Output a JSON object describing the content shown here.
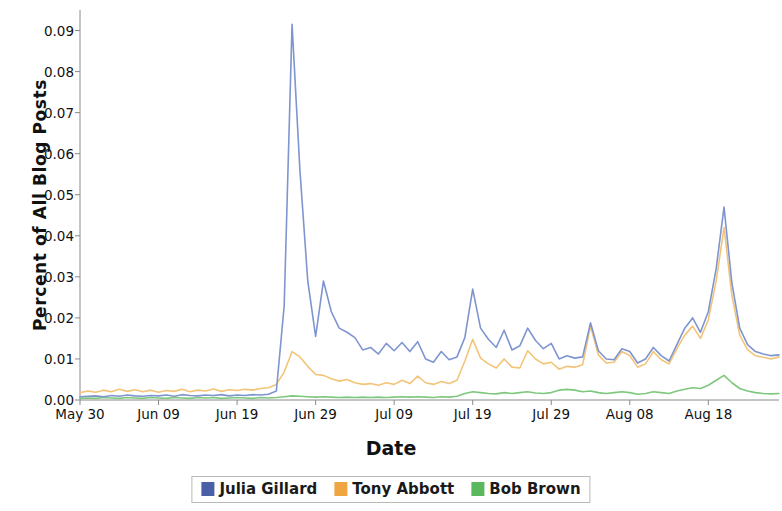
{
  "chart_data": {
    "type": "line",
    "title": "",
    "xlabel": "Date",
    "ylabel": "Percent of All Blog Posts",
    "grid": false,
    "legend_position": "bottom",
    "ylim": [
      0.0,
      0.095
    ],
    "ytick_labels": [
      "0.00",
      "0.01",
      "0.02",
      "0.03",
      "0.04",
      "0.05",
      "0.06",
      "0.07",
      "0.08",
      "0.09"
    ],
    "ytick_values": [
      0.0,
      0.01,
      0.02,
      0.03,
      0.04,
      0.05,
      0.06,
      0.07,
      0.08,
      0.09
    ],
    "xtick_labels": [
      "May 30",
      "Jun 09",
      "Jun 19",
      "Jun 29",
      "Jul 09",
      "Jul 19",
      "Jul 29",
      "Aug 08",
      "Aug 18"
    ],
    "xtick_indices": [
      0,
      10,
      20,
      30,
      40,
      50,
      60,
      70,
      80
    ],
    "x_index_count": 90,
    "series": [
      {
        "name": "Julia Gillard",
        "color": "#4a5fa5",
        "line_color": "#7f95d0",
        "values": [
          0.0008,
          0.0009,
          0.001,
          0.0008,
          0.0011,
          0.0009,
          0.0012,
          0.001,
          0.0009,
          0.0011,
          0.001,
          0.0012,
          0.0009,
          0.0013,
          0.0011,
          0.001,
          0.0012,
          0.0011,
          0.0013,
          0.001,
          0.0012,
          0.0011,
          0.0013,
          0.0012,
          0.0014,
          0.0022,
          0.023,
          0.0915,
          0.056,
          0.029,
          0.0155,
          0.029,
          0.0215,
          0.0175,
          0.0165,
          0.0152,
          0.0122,
          0.0128,
          0.0112,
          0.0138,
          0.012,
          0.014,
          0.0118,
          0.0142,
          0.01,
          0.0092,
          0.0118,
          0.0098,
          0.0105,
          0.0152,
          0.027,
          0.0175,
          0.0148,
          0.0128,
          0.017,
          0.0122,
          0.0132,
          0.0175,
          0.0145,
          0.0125,
          0.0138,
          0.01,
          0.0108,
          0.0102,
          0.0105,
          0.0188,
          0.012,
          0.01,
          0.0098,
          0.0125,
          0.0118,
          0.009,
          0.01,
          0.0128,
          0.0108,
          0.0095,
          0.0135,
          0.0175,
          0.02,
          0.0165,
          0.0215,
          0.032,
          0.047,
          0.0285,
          0.0175,
          0.0135,
          0.0118,
          0.0112,
          0.0108,
          0.011
        ]
      },
      {
        "name": "Tony Abbott",
        "color": "#f0a640",
        "line_color": "#f3c477",
        "values": [
          0.0018,
          0.0022,
          0.0019,
          0.0024,
          0.002,
          0.0026,
          0.0021,
          0.0025,
          0.002,
          0.0024,
          0.0019,
          0.0023,
          0.0021,
          0.0026,
          0.002,
          0.0024,
          0.0022,
          0.0027,
          0.0021,
          0.0025,
          0.0023,
          0.0026,
          0.0024,
          0.0028,
          0.003,
          0.0038,
          0.0068,
          0.0118,
          0.0105,
          0.0082,
          0.0062,
          0.006,
          0.0052,
          0.0046,
          0.005,
          0.0042,
          0.0038,
          0.004,
          0.0036,
          0.0042,
          0.0038,
          0.0048,
          0.004,
          0.0058,
          0.0042,
          0.0038,
          0.0045,
          0.004,
          0.0048,
          0.0095,
          0.0148,
          0.0102,
          0.0088,
          0.0078,
          0.01,
          0.008,
          0.0078,
          0.012,
          0.01,
          0.0088,
          0.0092,
          0.0075,
          0.0082,
          0.008,
          0.0086,
          0.018,
          0.011,
          0.009,
          0.0092,
          0.0118,
          0.0108,
          0.008,
          0.0088,
          0.0118,
          0.0098,
          0.0088,
          0.0125,
          0.0158,
          0.018,
          0.015,
          0.0195,
          0.029,
          0.042,
          0.0255,
          0.0158,
          0.0122,
          0.0108,
          0.0104,
          0.01,
          0.0105
        ]
      },
      {
        "name": "Bob Brown",
        "color": "#5cb85c",
        "line_color": "#7ec87e",
        "values": [
          0.0004,
          0.0005,
          0.0004,
          0.0006,
          0.0005,
          0.0004,
          0.0006,
          0.0005,
          0.0004,
          0.0006,
          0.0005,
          0.0004,
          0.0006,
          0.0005,
          0.0004,
          0.0006,
          0.0005,
          0.0006,
          0.0004,
          0.0005,
          0.0006,
          0.0005,
          0.0004,
          0.0006,
          0.0005,
          0.0006,
          0.0008,
          0.001,
          0.0009,
          0.0008,
          0.0007,
          0.0008,
          0.0007,
          0.0006,
          0.0007,
          0.0006,
          0.0007,
          0.0006,
          0.0007,
          0.0006,
          0.0007,
          0.0008,
          0.0007,
          0.0008,
          0.0007,
          0.0006,
          0.0008,
          0.0007,
          0.0009,
          0.0016,
          0.002,
          0.0018,
          0.0016,
          0.0015,
          0.0018,
          0.0016,
          0.0018,
          0.002,
          0.0017,
          0.0016,
          0.0018,
          0.0024,
          0.0026,
          0.0024,
          0.002,
          0.0022,
          0.0018,
          0.0016,
          0.0018,
          0.002,
          0.0018,
          0.0014,
          0.0016,
          0.002,
          0.0018,
          0.0016,
          0.0022,
          0.0026,
          0.003,
          0.0028,
          0.0036,
          0.0048,
          0.006,
          0.0042,
          0.0028,
          0.0022,
          0.0018,
          0.0016,
          0.0015,
          0.0016
        ]
      }
    ]
  },
  "legend": {
    "items": [
      {
        "label": "Julia Gillard",
        "color": "#4a5fa5"
      },
      {
        "label": "Tony Abbott",
        "color": "#f0a640"
      },
      {
        "label": "Bob Brown",
        "color": "#5cb85c"
      }
    ]
  },
  "axes": {
    "y_title": "Percent of All Blog Posts",
    "x_title": "Date"
  }
}
